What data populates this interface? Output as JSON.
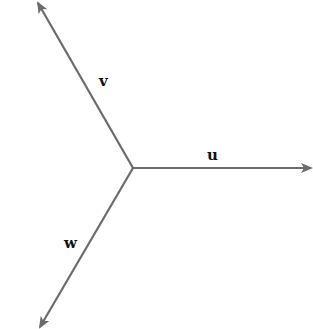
{
  "diagram": {
    "title": "",
    "origin": {
      "x": 133,
      "y": 168
    },
    "stroke_color": "#6b6b6b",
    "label_color": "#111111",
    "vectors": [
      {
        "name": "u",
        "label": "u",
        "end": {
          "x": 311,
          "y": 168
        },
        "label_pos": {
          "x": 207,
          "y": 148
        }
      },
      {
        "name": "v",
        "label": "v",
        "end": {
          "x": 38,
          "y": 3
        },
        "label_pos": {
          "x": 99,
          "y": 74
        }
      },
      {
        "name": "w",
        "label": "w",
        "end": {
          "x": 40,
          "y": 327
        },
        "label_pos": {
          "x": 64,
          "y": 236
        }
      }
    ]
  }
}
